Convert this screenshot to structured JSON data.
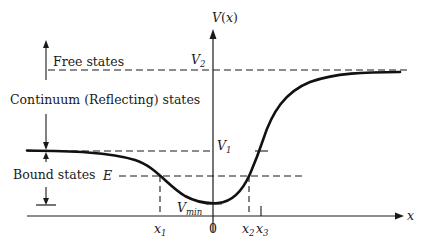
{
  "diagram": {
    "type": "potential-energy-curve",
    "axes": {
      "y_label": "V(x)",
      "x_label": "x",
      "origin_label": "0"
    },
    "levels": {
      "V2": {
        "label": "V",
        "sub": "2"
      },
      "V1": {
        "label": "V",
        "sub": "1"
      },
      "E": {
        "label": "E"
      },
      "Vmin": {
        "label": "V",
        "sub": "min"
      }
    },
    "x_ticks": [
      {
        "label": "x",
        "sub": "1"
      },
      {
        "label": "0"
      },
      {
        "label": "x",
        "sub": "2"
      },
      {
        "label": "x",
        "sub": "3"
      }
    ],
    "regions": {
      "free": "Free states",
      "continuum": "Continuum (Reflecting) states",
      "bound": "Bound states"
    },
    "colors": {
      "ink": "#1a1a1a",
      "background": "#ffffff"
    }
  }
}
